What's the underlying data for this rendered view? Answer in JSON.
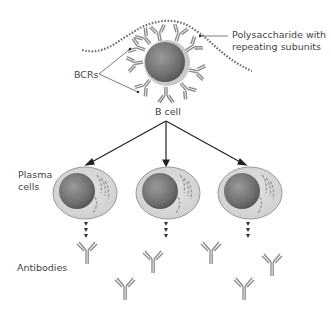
{
  "diagram": {
    "labels": {
      "polysaccharide": "Polysaccharide with",
      "polysaccharide_line2": "repeating subunits",
      "bcrs": "BCRs",
      "bcell": "B cell",
      "plasma": "Plasma",
      "plasma_line2": "cells",
      "antibodies": "Antibodies"
    },
    "colors": {
      "cell_halo": "#c8c8c8",
      "nucleus": "#777777",
      "plasma_cytoplasm": "#d9d9d9",
      "plasma_outline": "#9a9a9a",
      "receptor": "#8c8c8c",
      "arrow": "#222222",
      "polysaccharide": "#6e6e6e"
    },
    "plasma_cells": [
      {
        "cx": 97,
        "cy": 193
      },
      {
        "cx": 180,
        "cy": 193
      },
      {
        "cx": 264,
        "cy": 193
      }
    ],
    "antibodies": [
      {
        "x": 87,
        "y": 258
      },
      {
        "x": 153,
        "y": 267
      },
      {
        "x": 210,
        "y": 256
      },
      {
        "x": 272,
        "y": 268
      },
      {
        "x": 125,
        "y": 293
      },
      {
        "x": 243,
        "y": 293
      }
    ]
  }
}
